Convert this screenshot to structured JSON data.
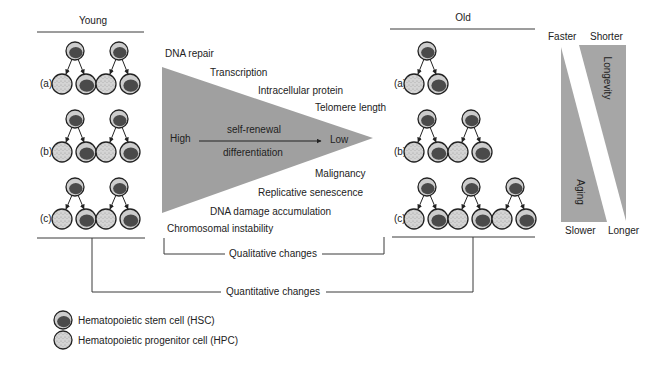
{
  "panels": {
    "young": {
      "title": "Young",
      "rows": [
        {
          "label": "(a)",
          "divisions": 2
        },
        {
          "label": "(b)",
          "divisions": 2
        },
        {
          "label": "(c)",
          "divisions": 2
        }
      ]
    },
    "old": {
      "title": "Old",
      "rows": [
        {
          "label": "(a)",
          "divisions": 1
        },
        {
          "label": "(b)",
          "divisions": 2
        },
        {
          "label": "(c)",
          "divisions": 3
        }
      ]
    }
  },
  "triangle": {
    "top_labels": [
      "DNA repair",
      "Transcription",
      "Intracellular protein",
      "Telomere length"
    ],
    "bottom_labels": [
      "Malignancy",
      "Replicative senescence",
      "DNA damage accumulation",
      "Chromosomal instability"
    ],
    "high": "High",
    "low": "Low",
    "arrow_above": "self-renewal",
    "arrow_below": "differentiation"
  },
  "brackets": {
    "qualitative": "Qualitative changes",
    "quantitative": "Quantitative changes"
  },
  "rate_bar": {
    "top_left": "Faster",
    "top_right": "Shorter",
    "bottom_left": "Slower",
    "bottom_right": "Longer",
    "aging": "Aging",
    "longevity": "Longevity"
  },
  "legend": [
    {
      "icon": "hsc-cell-icon",
      "label": "Hematopoietic stem cell (HSC)"
    },
    {
      "icon": "hpc-cell-icon",
      "label": "Hematopoietic progenitor cell (HPC)"
    }
  ],
  "colors": {
    "triangle_fill": "#a0a0a0",
    "bar_fill": "#a6a6a6",
    "cell_fill": "#cdcdcd",
    "nucleus_fill": "#4a4a4a",
    "outline": "#222222"
  }
}
